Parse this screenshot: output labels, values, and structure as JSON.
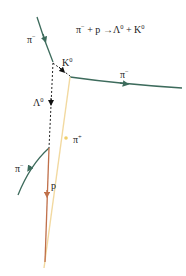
{
  "diagram": {
    "equation": {
      "lhs1": "π",
      "lhs1_sup": "−",
      "plus1": " + p ",
      "arrow": "→",
      "rhs1": "Λ",
      "rhs1_sup": "0",
      "plus2": " + K",
      "rhs2_sup": "0"
    },
    "labels": {
      "incoming_pion": {
        "base": "π",
        "sup": "−"
      },
      "kaon": {
        "base": "K",
        "sup": "0"
      },
      "kaon_decay_pion_minus": {
        "base": "π",
        "sup": "−"
      },
      "lambda": {
        "base": "Λ",
        "sup": "0"
      },
      "kaon_decay_pion_plus": {
        "base": "π",
        "sup": "+"
      },
      "lambda_decay_pion_minus": {
        "base": "π",
        "sup": "−"
      },
      "proton": {
        "base": "p"
      }
    },
    "colors": {
      "negative_pion_track": "#3d6b5c",
      "positive_pion_track": "#f2d9a0",
      "proton_track": "#c0704a",
      "neutral_track": "#222222",
      "text": "#222222"
    },
    "tracks": [
      {
        "name": "incoming π−",
        "type": "solid",
        "color": "negative_pion_track"
      },
      {
        "name": "K0",
        "type": "dashed",
        "color": "neutral_track"
      },
      {
        "name": "Λ0",
        "type": "dashed",
        "color": "neutral_track"
      },
      {
        "name": "π− (from K0)",
        "type": "solid",
        "color": "negative_pion_track"
      },
      {
        "name": "π+ (from K0)",
        "type": "solid",
        "color": "positive_pion_track"
      },
      {
        "name": "π− (from Λ0)",
        "type": "solid",
        "color": "negative_pion_track"
      },
      {
        "name": "p (from Λ0)",
        "type": "solid",
        "color": "proton_track"
      }
    ]
  }
}
